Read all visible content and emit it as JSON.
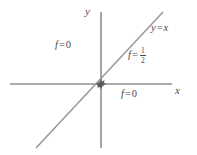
{
  "figure": {
    "canvas": {
      "width": 197,
      "height": 155,
      "background": "#ffffff"
    },
    "colors": {
      "axis": "#8f8f8f",
      "line": "#9a9a9a",
      "origin_marker": "#5a5a5a",
      "label_text": "#4a4a4a"
    },
    "axes": {
      "x_axis": {
        "label": "x",
        "name": "x-axis",
        "x1": 10,
        "y1": 84,
        "x2": 172,
        "y2": 84
      },
      "y_axis": {
        "label": "y",
        "name": "y-axis",
        "x1": 101,
        "y1": 12,
        "x2": 101,
        "y2": 148
      }
    },
    "lines": [
      {
        "name": "identity-line",
        "equation_label": "y = x",
        "lhs": "y",
        "operator": "=",
        "rhs": "x",
        "x1": 36,
        "y1": 148,
        "x2": 163,
        "y2": 12,
        "slope": 1
      }
    ],
    "origin": {
      "name": "origin-marker",
      "x": 101,
      "y": 84
    },
    "labels": {
      "f_zero_upper": {
        "name": "f-equals-zero-upper-left",
        "lhs": "f",
        "operator": "=",
        "value": "0",
        "full_text": "f = 0",
        "region": "upper-left-of-line"
      },
      "f_zero_lower": {
        "name": "f-equals-zero-lower-right",
        "lhs": "f",
        "operator": "=",
        "value": "0",
        "full_text": "f = 0",
        "region": "lower-right-of-line"
      },
      "f_half": {
        "name": "f-equals-one-half-on-line",
        "lhs": "f",
        "operator": "=",
        "numerator": "1",
        "denominator": "2",
        "full_text": "f = 1/2",
        "region": "on-line"
      }
    }
  }
}
